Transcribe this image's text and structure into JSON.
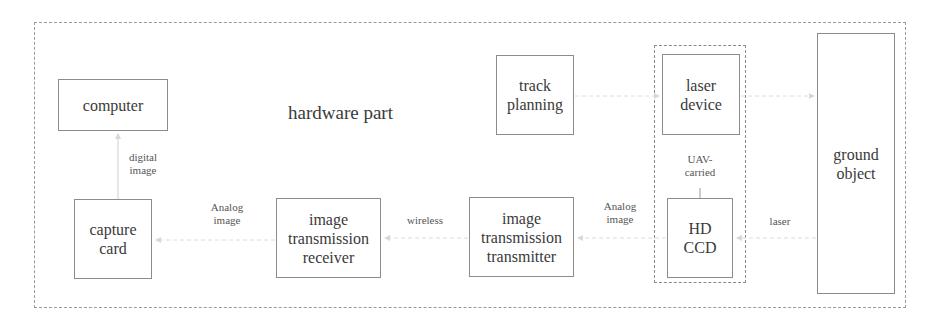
{
  "diagram": {
    "title": "hardware part",
    "nodes": {
      "computer": "computer",
      "capture_card": "capture\ncard",
      "receiver": "image\ntransmission\nreceiver",
      "transmitter": "image\ntransmission\ntransmitter",
      "track_planning": "track\nplanning",
      "laser_device": "laser\ndevice",
      "hd_ccd": "HD\nCCD",
      "ground_object": "ground\nobject"
    },
    "groups": {
      "uav_carried": "UAV-\ncarried"
    },
    "edge_labels": {
      "digital_image": "digital\nimage",
      "analog_image_left": "Analog\nimage",
      "wireless": "wireless",
      "analog_image_right": "Analog\nimage",
      "laser": "laser"
    },
    "edges": [
      {
        "from": "capture_card",
        "to": "computer",
        "label": "digital image"
      },
      {
        "from": "receiver",
        "to": "capture_card",
        "label": "Analog image"
      },
      {
        "from": "transmitter",
        "to": "receiver",
        "label": "wireless"
      },
      {
        "from": "hd_ccd",
        "to": "transmitter",
        "label": "Analog image"
      },
      {
        "from": "track_planning",
        "to": "laser_device",
        "label": ""
      },
      {
        "from": "laser_device",
        "to": "ground_object",
        "label": ""
      },
      {
        "from": "ground_object",
        "to": "hd_ccd",
        "label": "laser"
      }
    ],
    "colors": {
      "line": "#8c8c8c",
      "text": "#3a3a3a"
    }
  }
}
